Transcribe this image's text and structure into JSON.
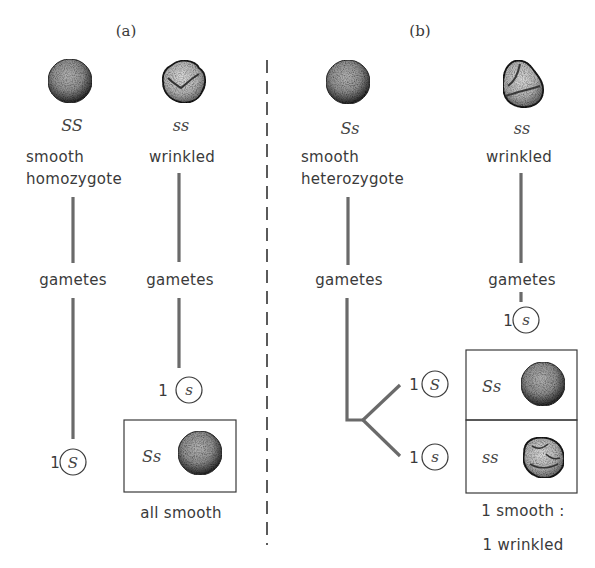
{
  "panels": {
    "a": {
      "label": "(a)",
      "parent1": {
        "genotype": "SS",
        "phenotype_line1": "smooth",
        "phenotype_line2": "homozygote",
        "seed": "smooth"
      },
      "parent2": {
        "genotype": "ss",
        "phenotype_line1": "wrinkled",
        "seed": "wrinkled"
      },
      "gametes_label_1": "gametes",
      "gametes_label_2": "gametes",
      "gamete1": {
        "count": "1",
        "allele": "S"
      },
      "gamete2": {
        "count": "1",
        "allele": "s"
      },
      "offspring": [
        {
          "genotype": "Ss",
          "seed": "smooth"
        }
      ],
      "result": "all smooth"
    },
    "b": {
      "label": "(b)",
      "parent1": {
        "genotype": "Ss",
        "phenotype_line1": "smooth",
        "phenotype_line2": "heterozygote",
        "seed": "smooth"
      },
      "parent2": {
        "genotype": "ss",
        "phenotype_line1": "wrinkled",
        "seed": "wrinkled"
      },
      "gametes_label_1": "gametes",
      "gametes_label_2": "gametes",
      "gamete_top": {
        "count": "1",
        "allele": "S"
      },
      "gamete_bottom": {
        "count": "1",
        "allele": "s"
      },
      "gamete_right": {
        "count": "1",
        "allele": "s"
      },
      "offspring": [
        {
          "genotype": "Ss",
          "seed": "smooth"
        },
        {
          "genotype": "ss",
          "seed": "wrinkled"
        }
      ],
      "result_line1": "1 smooth :",
      "result_line2": "1 wrinkled"
    }
  },
  "colors": {
    "ink": "#3a3a3a",
    "line": "#6a6a6a",
    "seed_dark": "#2a2a2a",
    "seed_mid": "#8a8a8a",
    "seed_light": "#c8c8c8"
  }
}
